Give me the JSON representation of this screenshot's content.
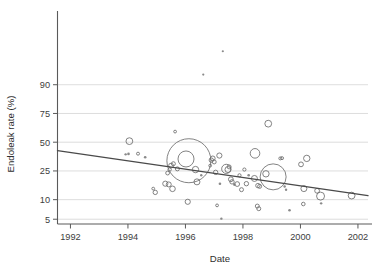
{
  "chart_data": {
    "type": "scatter",
    "title": "",
    "xlabel": "Date",
    "ylabel": "Endoleak rate (%)",
    "xlim": [
      1991.55,
      2002.35
    ],
    "ylim": [
      4.2,
      99.0
    ],
    "yscale": "logit",
    "grid": true,
    "legend": null,
    "xticks": [
      1992,
      1994,
      1996,
      1998,
      2000,
      2002
    ],
    "xtick_labels": [
      "1992",
      "1994",
      "1996",
      "1998",
      "2000",
      "2002"
    ],
    "yticks": [
      5,
      10,
      25,
      50,
      75,
      90
    ],
    "ytick_labels": [
      "5",
      "10",
      "25",
      "50",
      "75",
      "90"
    ],
    "marker": "open-circle",
    "marker_size_meaning": "study-weight",
    "series": [
      {
        "name": "Studies",
        "points": [
          {
            "x": 1994.05,
            "y": 51.0,
            "r": 3.4
          },
          {
            "x": 1994.02,
            "y": 39.0,
            "r": 1.3
          },
          {
            "x": 1994.35,
            "y": 39.2,
            "r": 1.5
          },
          {
            "x": 1993.92,
            "y": 38.6,
            "r": 1.2
          },
          {
            "x": 1994.6,
            "y": 36.0,
            "r": 1.3
          },
          {
            "x": 1994.88,
            "y": 14.5,
            "r": 1.4
          },
          {
            "x": 1994.95,
            "y": 12.8,
            "r": 2.2
          },
          {
            "x": 1995.3,
            "y": 17.0,
            "r": 2.6
          },
          {
            "x": 1995.42,
            "y": 16.6,
            "r": 2.5
          },
          {
            "x": 1995.55,
            "y": 14.4,
            "r": 2.8
          },
          {
            "x": 1995.38,
            "y": 23.5,
            "r": 1.9
          },
          {
            "x": 1995.45,
            "y": 26.0,
            "r": 1.7
          },
          {
            "x": 1995.5,
            "y": 29.0,
            "r": 2.4
          },
          {
            "x": 1995.58,
            "y": 30.5,
            "r": 2.0
          },
          {
            "x": 1995.72,
            "y": 26.5,
            "r": 2.0
          },
          {
            "x": 1995.64,
            "y": 60.0,
            "r": 1.4
          },
          {
            "x": 1996.02,
            "y": 34.5,
            "r": 8.0
          },
          {
            "x": 1996.12,
            "y": 33.0,
            "r": 22.0
          },
          {
            "x": 1996.35,
            "y": 26.0,
            "r": 3.2
          },
          {
            "x": 1996.4,
            "y": 18.0,
            "r": 3.0
          },
          {
            "x": 1996.08,
            "y": 9.3,
            "r": 2.6
          },
          {
            "x": 1996.55,
            "y": 22.0,
            "r": 1.2
          },
          {
            "x": 1996.9,
            "y": 33.5,
            "r": 2.2
          },
          {
            "x": 1996.95,
            "y": 35.0,
            "r": 2.4
          },
          {
            "x": 1997.0,
            "y": 32.0,
            "r": 2.0
          },
          {
            "x": 1996.86,
            "y": 29.0,
            "r": 1.4
          },
          {
            "x": 1997.05,
            "y": 24.0,
            "r": 2.2
          },
          {
            "x": 1997.18,
            "y": 37.5,
            "r": 2.6
          },
          {
            "x": 1997.2,
            "y": 17.0,
            "r": 1.3
          },
          {
            "x": 1997.1,
            "y": 8.2,
            "r": 1.4
          },
          {
            "x": 1997.25,
            "y": 5.1,
            "r": 1.2
          },
          {
            "x": 1997.42,
            "y": 26.5,
            "r": 4.6
          },
          {
            "x": 1997.48,
            "y": 26.0,
            "r": 3.0
          },
          {
            "x": 1997.52,
            "y": 28.0,
            "r": 2.0
          },
          {
            "x": 1997.58,
            "y": 19.5,
            "r": 2.4
          },
          {
            "x": 1997.62,
            "y": 18.0,
            "r": 2.2
          },
          {
            "x": 1997.7,
            "y": 16.5,
            "r": 1.3
          },
          {
            "x": 1997.8,
            "y": 16.8,
            "r": 2.4
          },
          {
            "x": 1997.88,
            "y": 22.0,
            "r": 1.6
          },
          {
            "x": 1997.95,
            "y": 14.0,
            "r": 2.0
          },
          {
            "x": 1998.05,
            "y": 26.0,
            "r": 1.6
          },
          {
            "x": 1998.12,
            "y": 17.0,
            "r": 2.2
          },
          {
            "x": 1998.2,
            "y": 22.0,
            "r": 1.3
          },
          {
            "x": 1998.42,
            "y": 39.5,
            "r": 4.8
          },
          {
            "x": 1998.4,
            "y": 20.0,
            "r": 3.0
          },
          {
            "x": 1998.52,
            "y": 16.0,
            "r": 2.2
          },
          {
            "x": 1998.58,
            "y": 15.6,
            "r": 2.0
          },
          {
            "x": 1998.5,
            "y": 8.0,
            "r": 2.0
          },
          {
            "x": 1998.55,
            "y": 7.3,
            "r": 2.0
          },
          {
            "x": 1998.88,
            "y": 67.0,
            "r": 3.4
          },
          {
            "x": 1998.8,
            "y": 23.0,
            "r": 3.2
          },
          {
            "x": 1999.05,
            "y": 21.0,
            "r": 13.0
          },
          {
            "x": 1999.3,
            "y": 35.0,
            "r": 1.5
          },
          {
            "x": 1999.36,
            "y": 35.2,
            "r": 1.5
          },
          {
            "x": 1999.45,
            "y": 15.5,
            "r": 1.2
          },
          {
            "x": 1999.5,
            "y": 14.0,
            "r": 1.2
          },
          {
            "x": 1999.62,
            "y": 6.9,
            "r": 1.3
          },
          {
            "x": 2000.02,
            "y": 30.0,
            "r": 2.4
          },
          {
            "x": 2000.12,
            "y": 14.5,
            "r": 3.0
          },
          {
            "x": 2000.22,
            "y": 35.0,
            "r": 3.2
          },
          {
            "x": 2000.1,
            "y": 8.6,
            "r": 1.8
          },
          {
            "x": 2000.58,
            "y": 13.5,
            "r": 2.4
          },
          {
            "x": 2000.7,
            "y": 11.3,
            "r": 4.0
          },
          {
            "x": 2000.72,
            "y": 8.8,
            "r": 1.2
          },
          {
            "x": 2001.78,
            "y": 11.5,
            "r": 3.4
          },
          {
            "x": 1997.3,
            "y": 97.0,
            "r": 1.1
          },
          {
            "x": 1996.62,
            "y": 93.0,
            "r": 1.1
          }
        ]
      }
    ],
    "regression_line": {
      "x_start": 1991.55,
      "y_start": 42.0,
      "x_end": 2002.35,
      "y_end": 11.5,
      "color": "#4a4a4a"
    }
  }
}
